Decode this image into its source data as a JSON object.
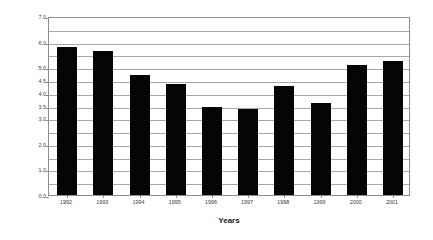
{
  "chart_data": {
    "type": "bar",
    "title": "",
    "xlabel": "Years",
    "ylabel": "kWh/US$",
    "categories": [
      "1992",
      "1993",
      "1994",
      "1995",
      "1996",
      "1997",
      "1998",
      "1999",
      "2000",
      "2001"
    ],
    "values": [
      5.8,
      5.65,
      4.7,
      4.35,
      3.45,
      3.35,
      4.25,
      3.6,
      5.1,
      5.25
    ],
    "series": [
      {
        "name": "kWh/US$",
        "values": [
          5.8,
          5.65,
          4.7,
          4.35,
          3.45,
          3.35,
          4.25,
          3.6,
          5.1,
          5.25
        ]
      }
    ],
    "ylim": [
      0.0,
      7.0
    ],
    "ytick_values": [
      0.0,
      1.0,
      2.0,
      3.0,
      3.5,
      4.0,
      4.5,
      5.0,
      6.0,
      7.0
    ],
    "ytick_labels": [
      "0.0",
      "1.0",
      "2.0",
      "3.0",
      "3.5",
      "4.0",
      "4.5",
      "5.0",
      "6.0",
      "7.0"
    ],
    "gridline_values": [
      0.5,
      1.0,
      1.5,
      2.0,
      2.5,
      3.0,
      3.5,
      4.0,
      4.5,
      5.0,
      5.5,
      6.0,
      6.5
    ],
    "grid": true,
    "legend": "none",
    "bar_color": "#050505",
    "grid_color": "#a8a8a8",
    "frame_color": "#8c8c8c",
    "background": "#ffffff"
  }
}
